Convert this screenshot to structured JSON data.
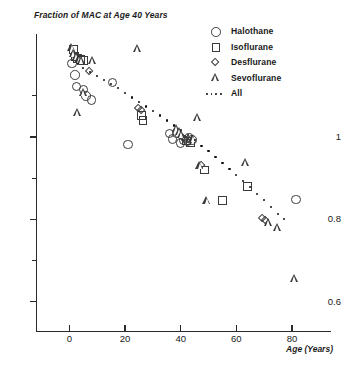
{
  "chart_data": {
    "type": "scatter",
    "title": "Fraction of MAC at Age 40 Years",
    "xlabel": "Age (Years)",
    "ylabel": "Fraction of MAC at Age 40 Years",
    "xlim": [
      -12,
      94
    ],
    "ylim": [
      0.53,
      1.25
    ],
    "xticks": [
      0,
      20,
      40,
      60,
      80
    ],
    "xtick_labels": [
      "0",
      "20",
      "40",
      "60",
      "80"
    ],
    "yticks": [
      1,
      0.8,
      0.6
    ],
    "ytick_labels": [
      "1",
      "0.8",
      "0.6"
    ],
    "yticks_minor": [
      1.1,
      0.9,
      0.7
    ],
    "grid": false,
    "legend_position": "top-right",
    "series": [
      {
        "name": "Halothane",
        "marker": "circle",
        "points": [
          [
            1.0,
            1.178
          ],
          [
            2.0,
            1.15
          ],
          [
            2.5,
            1.122
          ],
          [
            5.0,
            1.115
          ],
          [
            6.0,
            1.1
          ],
          [
            8.0,
            1.09
          ],
          [
            15.5,
            1.132
          ],
          [
            21.0,
            0.982
          ],
          [
            36.0,
            1.008
          ],
          [
            37.0,
            0.995
          ],
          [
            38.5,
            1.01
          ],
          [
            40.0,
            0.985
          ],
          [
            41.0,
            0.992
          ],
          [
            42.5,
            0.99
          ],
          [
            43.0,
            0.997
          ],
          [
            44.0,
            0.992
          ],
          [
            81.5,
            0.848
          ]
        ]
      },
      {
        "name": "Isoflurane",
        "marker": "square",
        "points": [
          [
            1.5,
            1.212
          ],
          [
            2.0,
            1.196
          ],
          [
            3.0,
            1.19
          ],
          [
            4.0,
            1.188
          ],
          [
            5.0,
            1.185
          ],
          [
            26.0,
            1.052
          ],
          [
            26.5,
            1.04
          ],
          [
            42.0,
            0.99
          ],
          [
            43.5,
            0.985
          ],
          [
            48.5,
            0.92
          ],
          [
            55.0,
            0.845
          ],
          [
            64.0,
            0.88
          ]
        ]
      },
      {
        "name": "Desflurane",
        "marker": "diamond",
        "points": [
          [
            2.0,
            1.196
          ],
          [
            3.0,
            1.186
          ],
          [
            7.5,
            1.158
          ],
          [
            25.0,
            1.068
          ],
          [
            26.0,
            1.062
          ],
          [
            41.0,
            0.996
          ],
          [
            42.0,
            0.992
          ],
          [
            47.5,
            0.93
          ],
          [
            69.5,
            0.8
          ],
          [
            70.5,
            0.797
          ]
        ]
      },
      {
        "name": "Sevoflurane",
        "marker": "triangle",
        "points": [
          [
            1.0,
            1.215
          ],
          [
            1.5,
            1.2
          ],
          [
            2.5,
            1.193
          ],
          [
            3.5,
            1.186
          ],
          [
            4.5,
            1.184
          ],
          [
            8.5,
            1.183
          ],
          [
            5.0,
            1.105
          ],
          [
            3.0,
            1.058
          ],
          [
            24.5,
            1.213
          ],
          [
            38.5,
            1.018
          ],
          [
            39.5,
            1.012
          ],
          [
            40.5,
            1.004
          ],
          [
            44.5,
            0.995
          ],
          [
            46.0,
            1.045
          ],
          [
            47.0,
            0.928
          ],
          [
            49.5,
            0.845
          ],
          [
            63.5,
            0.935
          ],
          [
            71.5,
            0.79
          ],
          [
            75.0,
            0.778
          ],
          [
            81.0,
            0.655
          ]
        ]
      }
    ],
    "fit_line": {
      "name": "All",
      "style": "dotted",
      "points": [
        [
          3.0,
          1.178
        ],
        [
          5.0,
          1.168
        ],
        [
          7.5,
          1.158
        ],
        [
          10.0,
          1.148
        ],
        [
          12.5,
          1.138
        ],
        [
          15.0,
          1.128
        ],
        [
          17.5,
          1.118
        ],
        [
          20.0,
          1.107
        ],
        [
          22.5,
          1.096
        ],
        [
          25.0,
          1.085
        ],
        [
          27.5,
          1.074
        ],
        [
          30.0,
          1.063
        ],
        [
          32.5,
          1.052
        ],
        [
          35.0,
          1.04
        ],
        [
          37.5,
          1.028
        ],
        [
          40.0,
          1.016
        ],
        [
          42.5,
          1.004
        ],
        [
          45.0,
          0.992
        ],
        [
          47.5,
          0.978
        ],
        [
          50.0,
          0.965
        ],
        [
          52.5,
          0.951
        ],
        [
          55.0,
          0.937
        ],
        [
          57.5,
          0.923
        ],
        [
          60.0,
          0.908
        ],
        [
          62.5,
          0.893
        ],
        [
          65.0,
          0.878
        ],
        [
          67.5,
          0.862
        ],
        [
          70.0,
          0.846
        ],
        [
          72.5,
          0.83
        ],
        [
          75.0,
          0.813
        ],
        [
          77.0,
          0.8
        ]
      ]
    }
  },
  "legend": {
    "items": [
      {
        "label": "Halothane",
        "marker": "circle"
      },
      {
        "label": "Isoflurane",
        "marker": "square"
      },
      {
        "label": "Desflurane",
        "marker": "diamond"
      },
      {
        "label": "Sevoflurane",
        "marker": "triangle"
      },
      {
        "label": "All",
        "marker": "dotted-line"
      }
    ]
  },
  "colors": {
    "axis": "#2b2b2b",
    "marker_stroke": "#3a3a3a",
    "fit_dot": "#101010",
    "text": "#1a1a1a",
    "background": "#ffffff"
  }
}
